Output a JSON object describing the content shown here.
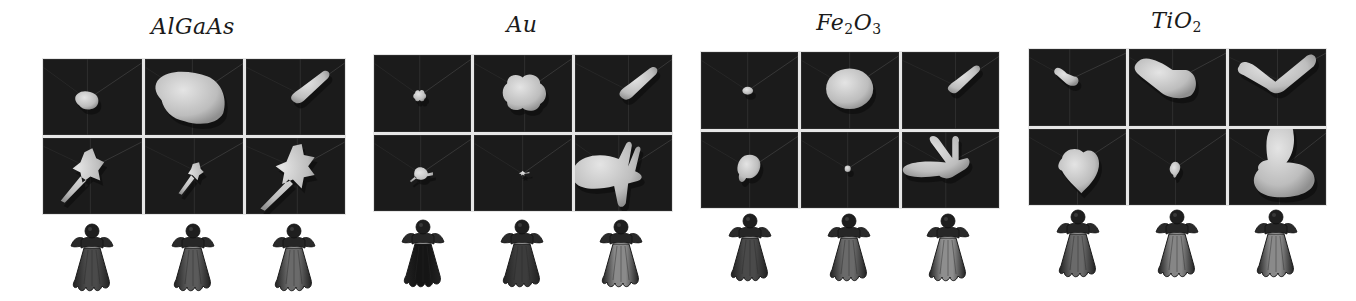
{
  "figure": {
    "panels": [
      {
        "id": "algaas",
        "title_main": "AlGaAs",
        "title_sub1": "",
        "title_mid": "",
        "title_sub2": "",
        "frame": {
          "x": 42,
          "y": 58,
          "w": 302,
          "h": 155,
          "title_y": 14
        },
        "figures_y": 222,
        "cells": [
          {
            "shape": "blob-small-irregular",
            "cx": 45,
            "cy": 40,
            "scale": 0.7
          },
          {
            "shape": "blob-large-irregular",
            "cx": 48,
            "cy": 38,
            "scale": 1.3
          },
          {
            "shape": "lobe-diagonal",
            "cx": 55,
            "cy": 35,
            "scale": 1.0
          },
          {
            "shape": "spiky-with-tail",
            "cx": 48,
            "cy": 30,
            "scale": 1.0
          },
          {
            "shape": "spiky-small-tail",
            "cx": 50,
            "cy": 32,
            "scale": 0.8
          },
          {
            "shape": "spiky-large-tail",
            "cx": 52,
            "cy": 30,
            "scale": 1.1
          }
        ],
        "figure_shades": [
          "#4a4a4a",
          "#5a5a5a",
          "#6a6a6a"
        ]
      },
      {
        "id": "au",
        "title_main": "Au",
        "title_sub1": "",
        "title_mid": "",
        "title_sub2": "",
        "frame": {
          "x": 373,
          "y": 54,
          "w": 298,
          "h": 156,
          "title_y": 12
        },
        "figures_y": 218,
        "cells": [
          {
            "shape": "blob-small-flower",
            "cx": 47,
            "cy": 40,
            "scale": 0.6
          },
          {
            "shape": "blob-medium-flower",
            "cx": 52,
            "cy": 36,
            "scale": 1.0
          },
          {
            "shape": "lobe-diagonal",
            "cx": 55,
            "cy": 35,
            "scale": 1.0
          },
          {
            "shape": "blob-small-spray",
            "cx": 48,
            "cy": 38,
            "scale": 0.7
          },
          {
            "shape": "tiny-burst",
            "cx": 50,
            "cy": 38,
            "scale": 0.5
          },
          {
            "shape": "multi-lobe-right",
            "cx": 45,
            "cy": 38,
            "scale": 1.2
          }
        ],
        "figure_shades": [
          "#151515",
          "#3c3c3c",
          "#8a8a8a"
        ]
      },
      {
        "id": "fe2o3",
        "title_main": "Fe",
        "title_sub1": "2",
        "title_mid": "O",
        "title_sub2": "3",
        "frame": {
          "x": 700,
          "y": 51,
          "w": 298,
          "h": 156,
          "title_y": 10
        },
        "figures_y": 212,
        "cells": [
          {
            "shape": "ellipsoid-small",
            "cx": 48,
            "cy": 38,
            "scale": 0.55
          },
          {
            "shape": "ellipsoid-large",
            "cx": 50,
            "cy": 36,
            "scale": 1.1
          },
          {
            "shape": "lobe-diagonal",
            "cx": 55,
            "cy": 33,
            "scale": 0.85
          },
          {
            "shape": "kidney",
            "cx": 50,
            "cy": 36,
            "scale": 0.9
          },
          {
            "shape": "sphere-tiny",
            "cx": 48,
            "cy": 36,
            "scale": 0.45
          },
          {
            "shape": "three-lobe-fan",
            "cx": 45,
            "cy": 32,
            "scale": 1.1
          }
        ],
        "figure_shades": [
          "#4a4a4a",
          "#6a6a6a",
          "#8e8e8e"
        ]
      },
      {
        "id": "tio2",
        "title_main": "Ti",
        "title_sub1": "",
        "title_mid": "O",
        "title_sub2": "2",
        "frame": {
          "x": 1028,
          "y": 48,
          "w": 297,
          "h": 156,
          "title_y": 8
        },
        "figures_y": 208,
        "cells": [
          {
            "shape": "lobe-left-small",
            "cx": 42,
            "cy": 30,
            "scale": 0.75
          },
          {
            "shape": "lobe-left-large",
            "cx": 45,
            "cy": 32,
            "scale": 1.15
          },
          {
            "shape": "v-shape",
            "cx": 50,
            "cy": 30,
            "scale": 1.1
          },
          {
            "shape": "heart-blob",
            "cx": 50,
            "cy": 35,
            "scale": 1.0
          },
          {
            "shape": "heart-small",
            "cx": 48,
            "cy": 38,
            "scale": 0.6
          },
          {
            "shape": "big-lobe-down",
            "cx": 52,
            "cy": 40,
            "scale": 1.2
          }
        ],
        "figure_shades": [
          "#6a6a6a",
          "#868686",
          "#8a8a8a"
        ]
      }
    ]
  }
}
